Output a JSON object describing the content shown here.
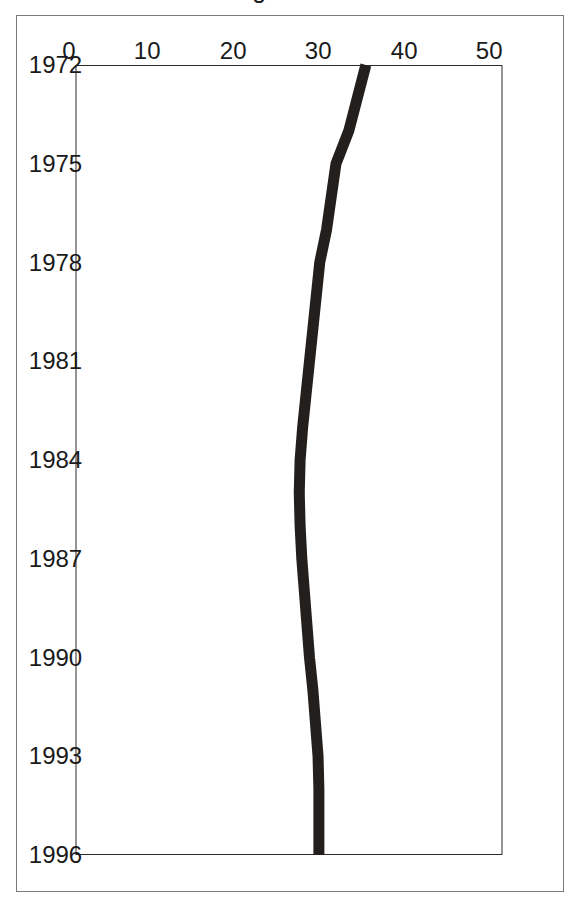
{
  "figure": {
    "background_color": "#ffffff",
    "frame_color": "#7a7a7a",
    "axis_color": "#2b2b2b",
    "series_color": "#231f1c"
  },
  "chart_data": {
    "type": "line",
    "title": "",
    "subtitle": "",
    "xlabel": "",
    "ylabel": "% favoring easier divorce",
    "x": [
      1972,
      1974,
      1975,
      1977,
      1978,
      1980,
      1982,
      1983,
      1984,
      1985,
      1986,
      1987,
      1988,
      1989,
      1990,
      1991,
      1993,
      1994,
      1996
    ],
    "values": [
      34.0,
      32.0,
      30.5,
      29.4,
      28.6,
      27.8,
      27.0,
      26.6,
      26.3,
      26.2,
      26.3,
      26.5,
      26.8,
      27.1,
      27.4,
      27.8,
      28.4,
      28.5,
      28.5
    ],
    "xtick_labels": [
      "1972",
      "1975",
      "1978",
      "1981",
      "1984",
      "1987",
      "1990",
      "1993",
      "1996"
    ],
    "xtick_values": [
      1972,
      1975,
      1978,
      1981,
      1984,
      1987,
      1990,
      1993,
      1996
    ],
    "ytick_labels": [
      "0",
      "10",
      "20",
      "30",
      "40",
      "50"
    ],
    "ytick_values": [
      0,
      10,
      20,
      30,
      40,
      50
    ],
    "xlim": [
      1972,
      1996
    ],
    "ylim": [
      0,
      50
    ],
    "grid": false,
    "legend": null,
    "legend_position": "none",
    "annotations": [],
    "orientation_note": "figure printed rotated 90 degrees clockwise on the page"
  }
}
